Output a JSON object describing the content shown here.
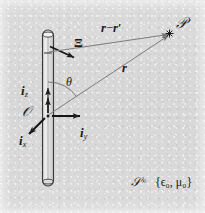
{
  "figure": {
    "type": "physics-diagram",
    "background_color": "#d9d9d9",
    "ink_color": "#1a1a1a",
    "width": 205,
    "height": 213
  },
  "labels": {
    "source_element": "Ξ",
    "observation_point": "𝒫",
    "origin": "𝒪",
    "separation_vector": "r − r′",
    "separation_vector_main": "r",
    "separation_vector_minus": "−",
    "separation_vector_prime": "r′",
    "position_vector": "r",
    "angle": "θ",
    "unit_vector_x_base": "i",
    "unit_vector_x_sub": "x",
    "unit_vector_y_base": "i",
    "unit_vector_y_sub": "y",
    "unit_vector_z_base": "i",
    "unit_vector_z_sub": "z",
    "domain_base": "𝒮",
    "domain_exponent": "∞",
    "medium_constants": "{ϵ₀, μ₀}"
  },
  "geometry": {
    "rod": {
      "x_center": 48,
      "top_y": 30,
      "bottom_y": 186,
      "width": 11,
      "fill": "#e8e8e8",
      "stroke": "#2b2b2b"
    },
    "origin_point": {
      "x": 48,
      "y": 116
    },
    "source_point": {
      "x": 48,
      "y": 53
    },
    "observation_point": {
      "x": 170,
      "y": 33
    },
    "angle_value_deg": 33
  }
}
